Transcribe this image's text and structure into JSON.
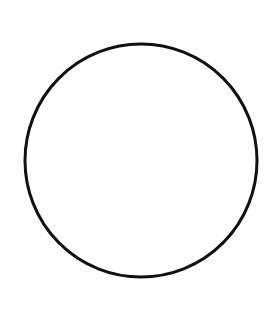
{
  "canvas": {
    "width": 280,
    "height": 310,
    "background_color": "#ffffff",
    "description": "Line drawing of a single empty circle outline"
  },
  "figure": {
    "name": "circle-outline",
    "shape_type": "circle",
    "stroke_color": "#111111",
    "fill_color": "none",
    "stroke_width": 3,
    "center_x": 141,
    "center_y": 160.5,
    "radius_x": 116,
    "radius_y": 116.5,
    "bounds": {
      "left": 25,
      "right": 257,
      "top": 44,
      "bottom": 277,
      "width": 232,
      "height": 233
    }
  },
  "chart_data": {
    "type": "line",
    "title": "",
    "xlabel": "",
    "ylabel": "",
    "shapes": [
      {
        "kind": "ellipse",
        "cx": 141,
        "cy": 160.5,
        "rx": 116,
        "ry": 116.5,
        "stroke": "#111111",
        "stroke_width": 3,
        "fill": "none"
      }
    ]
  }
}
